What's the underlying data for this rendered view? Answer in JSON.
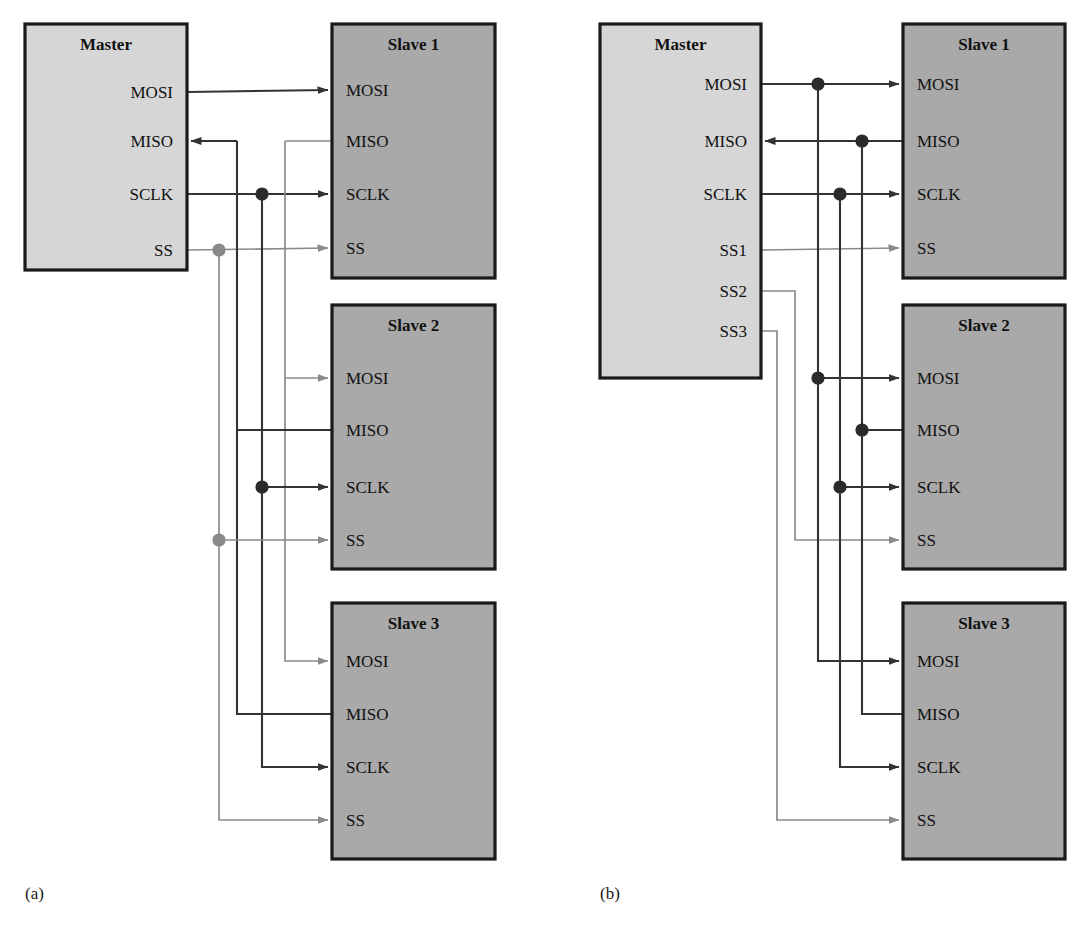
{
  "figure": {
    "type": "diagram",
    "background": "#ffffff",
    "colors": {
      "master_fill": "#d6d6d6",
      "slave_fill": "#a9a9a9",
      "box_stroke": "#1a1a1a",
      "wire_dark": "#333333",
      "wire_light": "#8a8a8a",
      "dot_dark": "#2b2b2b",
      "dot_light": "#8a8a8a",
      "text": "#111111"
    }
  },
  "panels": [
    {
      "id": "a",
      "caption": "(a)",
      "caption_pos": {
        "x": 25,
        "y": 884
      },
      "description": "Daisy-chain / shared slave-select SPI bus",
      "blocks": [
        {
          "name": "master",
          "title": "Master",
          "x": 25,
          "y": 24,
          "w": 162,
          "h": 246,
          "fill": "master_fill",
          "title_align": "center",
          "ports_align": "right",
          "ports": [
            {
              "label": "MOSI",
              "y": 92,
              "dir": "out",
              "wire": "dark"
            },
            {
              "label": "MISO",
              "y": 141,
              "dir": "in",
              "wire": "dark"
            },
            {
              "label": "SCLK",
              "y": 194,
              "dir": "out",
              "wire": "dark"
            },
            {
              "label": "SS",
              "y": 250,
              "dir": "out",
              "wire": "light"
            }
          ]
        },
        {
          "name": "slave-1",
          "title": "Slave 1",
          "x": 332,
          "y": 24,
          "w": 163,
          "h": 254,
          "fill": "slave_fill",
          "title_align": "center",
          "ports_align": "left",
          "ports": [
            {
              "label": "MOSI",
              "y": 90,
              "dir": "in",
              "wire": "dark"
            },
            {
              "label": "MISO",
              "y": 141,
              "dir": "out",
              "wire": "light"
            },
            {
              "label": "SCLK",
              "y": 194,
              "dir": "in",
              "wire": "dark"
            },
            {
              "label": "SS",
              "y": 248,
              "dir": "in",
              "wire": "light"
            }
          ]
        },
        {
          "name": "slave-2",
          "title": "Slave 2",
          "x": 332,
          "y": 305,
          "w": 163,
          "h": 264,
          "fill": "slave_fill",
          "title_align": "center",
          "ports_align": "left",
          "ports": [
            {
              "label": "MOSI",
              "y": 378,
              "dir": "in",
              "wire": "light"
            },
            {
              "label": "MISO",
              "y": 430,
              "dir": "out",
              "wire": "dark"
            },
            {
              "label": "SCLK",
              "y": 487,
              "dir": "in",
              "wire": "dark"
            },
            {
              "label": "SS",
              "y": 540,
              "dir": "in",
              "wire": "light"
            }
          ]
        },
        {
          "name": "slave-3",
          "title": "Slave 3",
          "x": 332,
          "y": 603,
          "w": 163,
          "h": 256,
          "fill": "slave_fill",
          "title_align": "center",
          "ports_align": "left",
          "ports": [
            {
              "label": "MOSI",
              "y": 661,
              "dir": "in",
              "wire": "light"
            },
            {
              "label": "MISO",
              "y": 714,
              "dir": "out",
              "wire": "dark"
            },
            {
              "label": "SCLK",
              "y": 767,
              "dir": "in",
              "wire": "dark"
            },
            {
              "label": "SS",
              "y": 820,
              "dir": "in",
              "wire": "light"
            }
          ]
        }
      ],
      "bus_lines": [
        {
          "name": "ss-bus",
          "x": 219,
          "y1": 250,
          "y2": 820,
          "wire": "light"
        },
        {
          "name": "miso-bus",
          "x": 237,
          "y1": 141,
          "y2": 714,
          "wire": "dark"
        },
        {
          "name": "sclk-bus",
          "x": 262,
          "y1": 194,
          "y2": 767,
          "wire": "dark"
        },
        {
          "name": "mosi-bus",
          "x": 285,
          "y1": 141,
          "y2": 661,
          "wire": "light"
        }
      ],
      "junction_dots": [
        {
          "name": "sclk-dot-slave1",
          "x": 262,
          "y": 194,
          "color": "dot_dark"
        },
        {
          "name": "ss-dot-slave1",
          "x": 219,
          "y": 250,
          "color": "dot_light"
        },
        {
          "name": "sclk-dot-slave2",
          "x": 262,
          "y": 487,
          "color": "dot_dark"
        },
        {
          "name": "ss-dot-slave2",
          "x": 219,
          "y": 540,
          "color": "dot_light"
        }
      ]
    },
    {
      "id": "b",
      "caption": "(b)",
      "caption_pos": {
        "x": 600,
        "y": 884
      },
      "description": "Independent slave-select SPI bus",
      "blocks": [
        {
          "name": "master",
          "title": "Master",
          "x": 600,
          "y": 24,
          "w": 161,
          "h": 354,
          "fill": "master_fill",
          "title_align": "center",
          "ports_align": "right",
          "ports": [
            {
              "label": "MOSI",
              "y": 84,
              "dir": "out",
              "wire": "dark"
            },
            {
              "label": "MISO",
              "y": 141,
              "dir": "in",
              "wire": "dark"
            },
            {
              "label": "SCLK",
              "y": 194,
              "dir": "out",
              "wire": "dark"
            },
            {
              "label": "SS1",
              "y": 250,
              "dir": "out",
              "wire": "light"
            },
            {
              "label": "SS2",
              "y": 291,
              "dir": "out",
              "wire": "dark"
            },
            {
              "label": "SS3",
              "y": 331,
              "dir": "out",
              "wire": "dark"
            }
          ]
        },
        {
          "name": "slave-1",
          "title": "Slave 1",
          "x": 903,
          "y": 24,
          "w": 162,
          "h": 254,
          "fill": "slave_fill",
          "title_align": "center",
          "ports_align": "left",
          "ports": [
            {
              "label": "MOSI",
              "y": 84,
              "dir": "in",
              "wire": "dark"
            },
            {
              "label": "MISO",
              "y": 141,
              "dir": "out",
              "wire": "dark"
            },
            {
              "label": "SCLK",
              "y": 194,
              "dir": "in",
              "wire": "dark"
            },
            {
              "label": "SS",
              "y": 248,
              "dir": "in",
              "wire": "light"
            }
          ]
        },
        {
          "name": "slave-2",
          "title": "Slave 2",
          "x": 903,
          "y": 305,
          "w": 162,
          "h": 264,
          "fill": "slave_fill",
          "title_align": "center",
          "ports_align": "left",
          "ports": [
            {
              "label": "MOSI",
              "y": 378,
              "dir": "in",
              "wire": "dark"
            },
            {
              "label": "MISO",
              "y": 430,
              "dir": "out",
              "wire": "dark"
            },
            {
              "label": "SCLK",
              "y": 487,
              "dir": "in",
              "wire": "dark"
            },
            {
              "label": "SS",
              "y": 540,
              "dir": "in",
              "wire": "light"
            }
          ]
        },
        {
          "name": "slave-3",
          "title": "Slave 3",
          "x": 903,
          "y": 603,
          "w": 162,
          "h": 256,
          "fill": "slave_fill",
          "title_align": "center",
          "ports_align": "left",
          "ports": [
            {
              "label": "MOSI",
              "y": 661,
              "dir": "in",
              "wire": "dark"
            },
            {
              "label": "MISO",
              "y": 714,
              "dir": "out",
              "wire": "dark"
            },
            {
              "label": "SCLK",
              "y": 767,
              "dir": "in",
              "wire": "dark"
            },
            {
              "label": "SS",
              "y": 820,
              "dir": "in",
              "wire": "light"
            }
          ]
        }
      ],
      "bus_lines": [
        {
          "name": "ss3-bus",
          "x": 777,
          "y1": 331,
          "y2": 820,
          "wire": "light"
        },
        {
          "name": "ss2-bus",
          "x": 795,
          "y1": 291,
          "y2": 540,
          "wire": "light"
        },
        {
          "name": "mosi-bus",
          "x": 818,
          "y1": 84,
          "y2": 661,
          "wire": "dark"
        },
        {
          "name": "sclk-bus",
          "x": 840,
          "y1": 194,
          "y2": 767,
          "wire": "dark"
        },
        {
          "name": "miso-bus",
          "x": 862,
          "y1": 141,
          "y2": 714,
          "wire": "dark"
        }
      ],
      "junction_dots": [
        {
          "name": "mosi-dot-slave1",
          "x": 818,
          "y": 84,
          "color": "dot_dark"
        },
        {
          "name": "miso-dot-slave1",
          "x": 862,
          "y": 141,
          "color": "dot_dark"
        },
        {
          "name": "sclk-dot-slave1",
          "x": 840,
          "y": 194,
          "color": "dot_dark"
        },
        {
          "name": "mosi-dot-slave2",
          "x": 818,
          "y": 378,
          "color": "dot_dark"
        },
        {
          "name": "miso-dot-slave2",
          "x": 862,
          "y": 430,
          "color": "dot_dark"
        },
        {
          "name": "sclk-dot-slave2",
          "x": 840,
          "y": 487,
          "color": "dot_dark"
        }
      ]
    }
  ]
}
